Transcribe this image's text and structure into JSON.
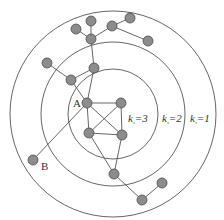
{
  "diagram": {
    "type": "k-shell decomposition",
    "colors": {
      "ring": "#555555",
      "edge": "#555555",
      "node_fill": "#8c8c8c",
      "node_stroke": "#4a4a4a"
    },
    "rings": [
      {
        "id": "outer",
        "cx": 113,
        "cy": 114,
        "r": 103,
        "label_k": "k",
        "label_sub": "s",
        "label_val": "=1"
      },
      {
        "id": "middle",
        "cx": 113,
        "cy": 114,
        "r": 72,
        "label_k": "k",
        "label_sub": "s",
        "label_val": "=2"
      },
      {
        "id": "inner",
        "cx": 113,
        "cy": 114,
        "r": 45,
        "label_k": "k",
        "label_sub": "s",
        "label_val": "=3"
      }
    ],
    "nodes": [
      {
        "id": "n1",
        "x": 76,
        "y": 29
      },
      {
        "id": "n2",
        "x": 91,
        "y": 21
      },
      {
        "id": "n3",
        "x": 112,
        "y": 26
      },
      {
        "id": "n4",
        "x": 130,
        "y": 18
      },
      {
        "id": "n5",
        "x": 148,
        "y": 41
      },
      {
        "id": "hub",
        "x": 91,
        "y": 39
      },
      {
        "id": "n7",
        "x": 94,
        "y": 68
      },
      {
        "id": "n8",
        "x": 47,
        "y": 63
      },
      {
        "id": "n9",
        "x": 71,
        "y": 80
      },
      {
        "id": "A",
        "x": 87,
        "y": 103,
        "label": "A"
      },
      {
        "id": "n11",
        "x": 121,
        "y": 103
      },
      {
        "id": "n12",
        "x": 89,
        "y": 133
      },
      {
        "id": "n13",
        "x": 122,
        "y": 135
      },
      {
        "id": "B",
        "x": 33,
        "y": 160,
        "label": "B"
      },
      {
        "id": "n15",
        "x": 114,
        "y": 174
      },
      {
        "id": "n16",
        "x": 162,
        "y": 183
      },
      {
        "id": "n17",
        "x": 142,
        "y": 200
      }
    ],
    "labels": {
      "A": "A",
      "B": "B"
    }
  }
}
